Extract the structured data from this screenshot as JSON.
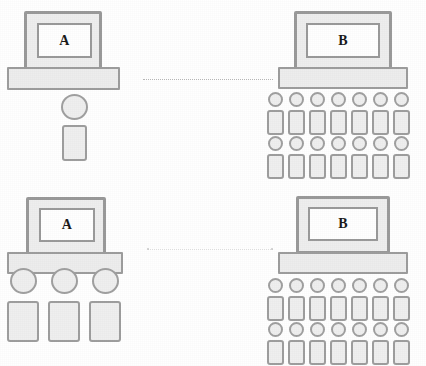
{
  "diagram": {
    "background_color": "#ffffff",
    "line_color": "#9a9a9a",
    "fill_color": "#eeeeee",
    "screen_color": "#ffffff",
    "label_color": "#1b1b1b",
    "link_color": "#b9b9b9"
  },
  "scenes": [
    {
      "id": "top-left",
      "terminal_label": "A",
      "terminal_name": "computer-a-top",
      "people_count": 1,
      "people_rows": 1,
      "people_per_row": 1,
      "person_size": "large"
    },
    {
      "id": "top-right",
      "terminal_label": "B",
      "terminal_name": "computer-b-top",
      "people_count": 14,
      "people_rows": 2,
      "people_per_row": 7,
      "person_size": "small"
    },
    {
      "id": "bottom-left",
      "terminal_label": "A",
      "terminal_name": "computer-a-bottom",
      "people_count": 3,
      "people_rows": 1,
      "people_per_row": 3,
      "person_size": "large"
    },
    {
      "id": "bottom-right",
      "terminal_label": "B",
      "terminal_name": "computer-b-bottom",
      "people_count": 14,
      "people_rows": 2,
      "people_per_row": 7,
      "person_size": "small"
    }
  ],
  "links": [
    {
      "id": "link-top",
      "from": "A",
      "to": "B",
      "style": "dotted"
    },
    {
      "id": "link-bottom",
      "from": "A",
      "to": "B",
      "style": "dotted-faint"
    }
  ]
}
